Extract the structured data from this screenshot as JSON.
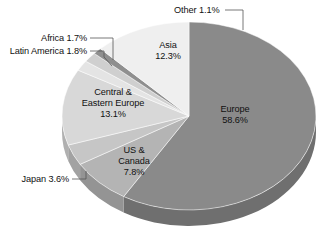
{
  "chart_data": {
    "type": "pie",
    "title": "",
    "subtitle": "",
    "xlabel": "",
    "ylabel": "",
    "legend_position": "none",
    "grid": false,
    "units": "percent",
    "start_angle_deg": 0,
    "direction": "clockwise",
    "three_d": true,
    "categories": [
      "Europe",
      "US & Canada",
      "Japan",
      "Central & Eastern Europe",
      "Latin America",
      "Africa",
      "Other",
      "Asia"
    ],
    "values": [
      58.6,
      7.8,
      3.6,
      13.1,
      1.8,
      1.7,
      1.1,
      12.3
    ],
    "total": 100.0,
    "slices": [
      {
        "name": "Europe",
        "value": 58.6,
        "value_label": "58.6%",
        "label_line1": "Europe",
        "label_line2": "58.6%",
        "color": "#8a8a8a",
        "side_color": "#6f6f6f",
        "label_placement": "inside",
        "label_x": 235,
        "label_y": 112
      },
      {
        "name": "US & Canada",
        "value": 7.8,
        "value_label": "7.8%",
        "label_line1": "US &",
        "label_line2": "Canada",
        "label_line3": "7.8%",
        "color": "#b4b4b4",
        "side_color": "#949494",
        "label_placement": "inside",
        "label_x": 134,
        "label_y": 153
      },
      {
        "name": "Japan",
        "value": 3.6,
        "value_label": "3.6%",
        "label_line1": "Japan 3.6%",
        "color": "#c6c6c6",
        "side_color": "#a2a2a2",
        "label_placement": "callout",
        "label_x": 69,
        "label_y": 182
      },
      {
        "name": "Central & Eastern Europe",
        "value": 13.1,
        "value_label": "13.1%",
        "label_line1": "Central &",
        "label_line2": "Eastern Europe",
        "label_line3": "13.1%",
        "color": "#d8d8d8",
        "side_color": "#b0b0b0",
        "label_placement": "inside",
        "label_x": 113,
        "label_y": 95
      },
      {
        "name": "Latin America",
        "value": 1.8,
        "value_label": "1.8%",
        "label_line1": "Latin America 1.8%",
        "color": "#e4e4e4",
        "side_color": "#bcbcbc",
        "label_placement": "callout",
        "label_x": 87,
        "label_y": 54
      },
      {
        "name": "Africa",
        "value": 1.7,
        "value_label": "1.7%",
        "label_line1": "Africa 1.7%",
        "color": "#cfcfcf",
        "side_color": "#a8a8a8",
        "label_placement": "callout",
        "label_x": 87,
        "label_y": 41
      },
      {
        "name": "Other",
        "value": 1.1,
        "value_label": "1.1%",
        "label_line1": "Other 1.1%",
        "color": "#8f8f8f",
        "side_color": "#747474",
        "label_placement": "callout",
        "label_x": 174,
        "label_y": 13
      },
      {
        "name": "Asia",
        "value": 12.3,
        "value_label": "12.3%",
        "label_line1": "Asia",
        "label_line2": "12.3%",
        "color": "#efefef",
        "side_color": "#c4c4c4",
        "label_placement": "inside",
        "label_x": 168,
        "label_y": 48
      }
    ],
    "geometry": {
      "center_x": 189,
      "center_y": 116,
      "radius_x": 127,
      "radius_y": 94,
      "depth": 16
    },
    "background_color": "#ffffff",
    "text_color": "#111111",
    "leader_line_color": "#555555"
  }
}
